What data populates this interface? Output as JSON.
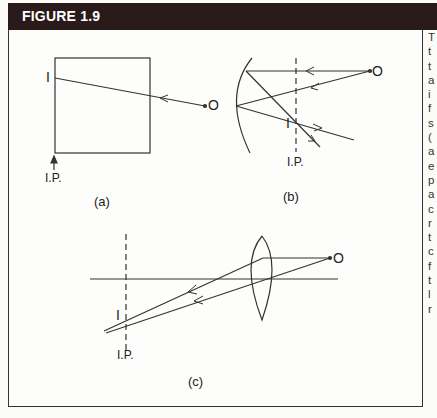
{
  "figure": {
    "title": "FIGURE 1.9",
    "panels": [
      {
        "id": "a",
        "caption": "(a)",
        "object_label": "O",
        "image_label": "I",
        "image_plane_label": "I.P."
      },
      {
        "id": "b",
        "caption": "(b)",
        "object_label": "O",
        "image_label": "I",
        "image_plane_label": "I.P."
      },
      {
        "id": "c",
        "caption": "(c)",
        "object_label": "O",
        "image_label": "I",
        "image_plane_label": "I.P."
      }
    ]
  },
  "side_text_fragments": [
    "T",
    "t",
    "t",
    "a",
    "i",
    "f",
    "s",
    "(",
    "a",
    "e",
    "p",
    "a",
    "c",
    "r",
    "t",
    "c",
    "f",
    "t",
    "l",
    "r"
  ],
  "colors": {
    "header_bg": "#2a1a1a",
    "line": "#333333",
    "page": "#fdfdfb"
  }
}
